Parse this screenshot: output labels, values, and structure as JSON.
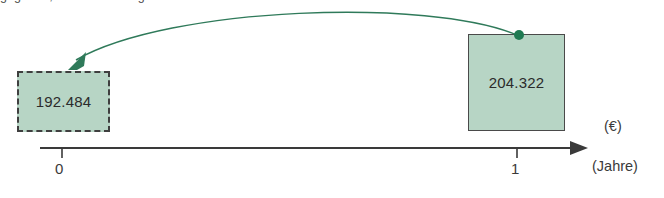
{
  "diagram": {
    "type": "timeline-discounting",
    "clipped_top_text": "gegeben, sodass sich ergibt:",
    "present_value": {
      "label": "192.484",
      "period": "0",
      "border_style": "dashed"
    },
    "future_value": {
      "label": "204.322",
      "period": "1",
      "border_style": "solid"
    },
    "axis": {
      "ticks": [
        "0",
        "1"
      ],
      "value_axis_unit": "(€)",
      "time_axis_unit": "(Jahre)"
    },
    "colors": {
      "box_fill": "#b7d5c5",
      "arrow": "#2f7a5a",
      "axis": "#3a3a3a",
      "text": "#2b2b2b"
    },
    "icons": {
      "arc_arrow": "discount-arrow-icon",
      "anchor_dot": "anchor-dot-icon",
      "axis_arrow": "axis-arrowhead-icon"
    }
  }
}
